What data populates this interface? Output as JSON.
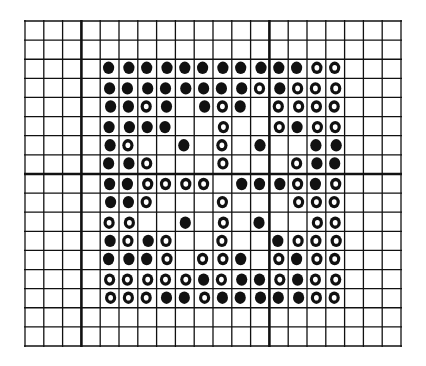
{
  "figure": {
    "colors": {
      "background": "#ffffff",
      "ink": "#111111"
    },
    "grid": {
      "left": 25,
      "top": 21,
      "right": 401,
      "bottom": 346,
      "columns": 20,
      "rows": 17,
      "thick_vertical_lines": [
        3,
        13
      ],
      "thick_horizontal_lines": [
        8
      ]
    },
    "dot_block": {
      "first_column": 4,
      "first_row": 2,
      "size": 13,
      "legend": {
        "0": "empty",
        "1": "dot"
      },
      "matrix": [
        [
          1,
          1,
          1,
          1,
          1,
          1,
          1,
          1,
          1,
          1,
          1,
          1,
          1
        ],
        [
          1,
          1,
          1,
          1,
          1,
          1,
          1,
          1,
          1,
          1,
          1,
          1,
          1
        ],
        [
          1,
          1,
          1,
          1,
          0,
          1,
          1,
          1,
          0,
          1,
          1,
          1,
          1
        ],
        [
          1,
          1,
          1,
          1,
          0,
          0,
          1,
          0,
          0,
          1,
          1,
          1,
          1
        ],
        [
          1,
          1,
          0,
          0,
          1,
          0,
          1,
          0,
          1,
          0,
          0,
          1,
          1
        ],
        [
          1,
          1,
          1,
          0,
          0,
          0,
          1,
          0,
          0,
          0,
          1,
          1,
          1
        ],
        [
          1,
          1,
          1,
          1,
          1,
          1,
          0,
          1,
          1,
          1,
          1,
          1,
          1
        ],
        [
          1,
          1,
          1,
          0,
          0,
          0,
          1,
          0,
          0,
          0,
          1,
          1,
          1
        ],
        [
          1,
          1,
          0,
          0,
          1,
          0,
          1,
          0,
          1,
          0,
          0,
          1,
          1
        ],
        [
          1,
          1,
          1,
          1,
          0,
          0,
          1,
          0,
          0,
          1,
          1,
          1,
          1
        ],
        [
          1,
          1,
          1,
          1,
          0,
          1,
          1,
          1,
          0,
          1,
          1,
          1,
          1
        ],
        [
          1,
          1,
          1,
          1,
          1,
          1,
          1,
          1,
          1,
          1,
          1,
          1,
          1
        ],
        [
          1,
          1,
          1,
          1,
          1,
          1,
          1,
          1,
          1,
          1,
          1,
          1,
          1
        ]
      ],
      "ring_cells": [
        [
          0,
          11
        ],
        [
          0,
          12
        ],
        [
          1,
          8
        ],
        [
          1,
          10
        ],
        [
          1,
          11
        ],
        [
          1,
          12
        ],
        [
          2,
          2
        ],
        [
          2,
          6
        ],
        [
          2,
          9
        ],
        [
          2,
          10
        ],
        [
          2,
          11
        ],
        [
          2,
          12
        ],
        [
          3,
          6
        ],
        [
          3,
          9
        ],
        [
          3,
          11
        ],
        [
          3,
          12
        ],
        [
          4,
          1
        ],
        [
          4,
          6
        ],
        [
          5,
          2
        ],
        [
          5,
          6
        ],
        [
          5,
          10
        ],
        [
          6,
          2
        ],
        [
          6,
          3
        ],
        [
          6,
          4
        ],
        [
          6,
          5
        ],
        [
          6,
          10
        ],
        [
          6,
          12
        ],
        [
          7,
          2
        ],
        [
          7,
          6
        ],
        [
          7,
          10
        ],
        [
          7,
          11
        ],
        [
          7,
          12
        ],
        [
          8,
          0
        ],
        [
          8,
          1
        ],
        [
          8,
          6
        ],
        [
          8,
          11
        ],
        [
          8,
          12
        ],
        [
          9,
          1
        ],
        [
          9,
          3
        ],
        [
          9,
          6
        ],
        [
          9,
          10
        ],
        [
          9,
          11
        ],
        [
          9,
          12
        ],
        [
          10,
          3
        ],
        [
          10,
          5
        ],
        [
          10,
          6
        ],
        [
          10,
          9
        ],
        [
          10,
          11
        ],
        [
          10,
          12
        ],
        [
          11,
          0
        ],
        [
          11,
          1
        ],
        [
          11,
          2
        ],
        [
          11,
          3
        ],
        [
          11,
          4
        ],
        [
          11,
          6
        ],
        [
          11,
          9
        ],
        [
          11,
          11
        ],
        [
          11,
          12
        ],
        [
          12,
          0
        ],
        [
          12,
          1
        ],
        [
          12,
          2
        ],
        [
          12,
          5
        ],
        [
          12,
          11
        ],
        [
          12,
          12
        ]
      ]
    }
  }
}
